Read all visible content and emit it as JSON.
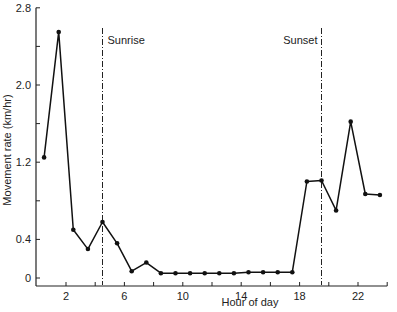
{
  "chart_data": {
    "type": "line",
    "title": "",
    "xlabel": "Hour of day",
    "ylabel": "Movement rate (km/hr)",
    "xlim": [
      0,
      24
    ],
    "ylim": [
      0,
      2.8
    ],
    "x_ticks": [
      2,
      6,
      10,
      14,
      18,
      22
    ],
    "y_ticks": [
      0,
      0.4,
      1.2,
      2.0,
      2.8
    ],
    "y_tick_labels": [
      "0",
      "0.4",
      "1.2",
      "2.0",
      "2.8"
    ],
    "grid": false,
    "legend": null,
    "annotations": [
      {
        "label": "Sunrise",
        "x": 4.5,
        "style": "dash-dot vertical line"
      },
      {
        "label": "Sunset",
        "x": 19.5,
        "style": "dash-dot vertical line"
      }
    ],
    "series": [
      {
        "name": "Movement rate",
        "x": [
          0.5,
          1.5,
          2.5,
          3.5,
          4.5,
          5.5,
          6.5,
          7.5,
          8.5,
          9.5,
          10.5,
          11.5,
          12.5,
          13.5,
          14.5,
          15.5,
          16.5,
          17.5,
          18.5,
          19.5,
          20.5,
          21.5,
          22.5,
          23.5
        ],
        "values": [
          1.25,
          2.55,
          0.5,
          0.3,
          0.58,
          0.36,
          0.07,
          0.16,
          0.05,
          0.05,
          0.05,
          0.05,
          0.05,
          0.05,
          0.06,
          0.06,
          0.06,
          0.06,
          1.0,
          1.01,
          0.7,
          1.62,
          0.87,
          0.86
        ]
      }
    ]
  }
}
